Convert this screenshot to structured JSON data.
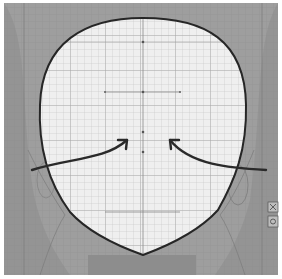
{
  "diagram": {
    "colors": {
      "background": "#ffffff",
      "outer_fill": "#9c9c9c",
      "outer_shade": "#8a8a8a",
      "face_fill": "#eeeeee",
      "grid_minor": "#c8c8c8",
      "grid_major": "#9a9a9a",
      "outline": "#262626",
      "arrow": "#2a2a2a"
    },
    "face_outline": {
      "path": "M 143 18 C 205 18 245 40 246 105 C 247 150 235 180 218 210 C 200 230 170 245 143 255 C 115 245 88 232 70 212 C 50 185 38 150 40 105 C 42 42 85 18 143 18 Z"
    },
    "arrows": [
      {
        "name": "left-arrow",
        "path": "M 32 170 C 70 158 105 160 127 140",
        "head": [
          127,
          140
        ]
      },
      {
        "name": "right-arrow",
        "path": "M 266 170 C 230 168 190 165 170 140",
        "head": [
          170,
          140
        ]
      }
    ],
    "side_markers": [
      {
        "name": "marker-top",
        "x": 273,
        "y": 207
      },
      {
        "name": "marker-bottom",
        "x": 273,
        "y": 222
      }
    ]
  }
}
